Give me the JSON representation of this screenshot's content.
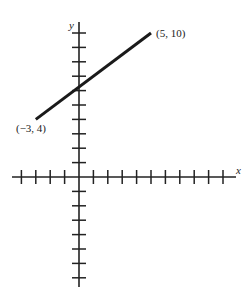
{
  "chart_data": {
    "type": "line",
    "title": "",
    "xlabel": "x",
    "ylabel": "y",
    "xlim": [
      -4,
      10
    ],
    "ylim": [
      -7,
      10
    ],
    "grid": false,
    "x_ticks": [
      -4,
      -3,
      -2,
      -1,
      1,
      2,
      3,
      4,
      5,
      6,
      7,
      8,
      9,
      10
    ],
    "y_ticks": [
      -7,
      -6,
      -5,
      -4,
      -3,
      -2,
      -1,
      1,
      2,
      3,
      4,
      5,
      6,
      7,
      8,
      9,
      10
    ],
    "series": [
      {
        "name": "segment",
        "points": [
          {
            "x": -3,
            "y": 4
          },
          {
            "x": 5,
            "y": 10
          }
        ]
      }
    ],
    "annotations": [
      {
        "text": "(−3, 4)",
        "x": -3,
        "y": 4
      },
      {
        "text": "(5, 10)",
        "x": 5,
        "y": 10
      }
    ]
  },
  "labels": {
    "x_axis": "x",
    "y_axis": "y",
    "start_point": "(−3, 4)",
    "end_point": "(5, 10)"
  },
  "colors": {
    "axis": "#222222",
    "line": "#1a1a1a"
  }
}
